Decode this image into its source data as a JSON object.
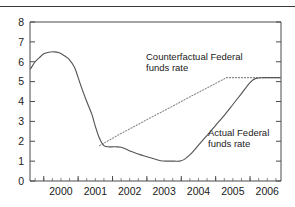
{
  "chart_data": {
    "type": "line",
    "title": "",
    "subtitle": "",
    "xlabel": "",
    "ylabel": "",
    "xlim": [
      1999.6,
      2006.9
    ],
    "ylim": [
      0,
      8
    ],
    "grid": false,
    "legend_position": "inline-annotations",
    "y_ticks": [
      "0",
      "1",
      "2",
      "3",
      "4",
      "5",
      "6",
      "7",
      "8"
    ],
    "y_tick_values": [
      0,
      1,
      2,
      3,
      4,
      5,
      6,
      7,
      8
    ],
    "x_ticks": [
      "2000",
      "2001",
      "2002",
      "2003",
      "2004",
      "2005",
      "2006"
    ],
    "x_tick_values": [
      2000,
      2001,
      2002,
      2003,
      2004,
      2005,
      2006
    ],
    "x_minor_interval": 0.25,
    "annotations": [
      {
        "name": "counterfactual-label",
        "line1": "Counterfactual Federal",
        "line2": "funds rate"
      },
      {
        "name": "actual-label",
        "line1": "Actual Federal",
        "line2": "funds rate"
      }
    ],
    "series": [
      {
        "name": "Actual Federal funds rate",
        "style": "solid",
        "color": "#555555",
        "x": [
          1999.62,
          1999.75,
          1999.9,
          2000.0,
          2000.15,
          2000.3,
          2000.45,
          2000.6,
          2000.75,
          2000.9,
          2001.0,
          2001.12,
          2001.25,
          2001.4,
          2001.5,
          2001.62,
          2001.75,
          2001.9,
          2002.0,
          2002.12,
          2002.25,
          2002.4,
          2002.55,
          2002.7,
          2002.85,
          2003.0,
          2003.2,
          2003.4,
          2003.6,
          2003.8,
          2003.95,
          2004.1,
          2004.3,
          2004.5,
          2004.75,
          2005.0,
          2005.25,
          2005.5,
          2005.75,
          2006.0,
          2006.15,
          2006.4,
          2006.7,
          2006.88
        ],
        "y": [
          5.65,
          6.0,
          6.25,
          6.4,
          6.48,
          6.5,
          6.45,
          6.3,
          6.1,
          5.7,
          5.2,
          4.6,
          4.0,
          3.35,
          2.75,
          2.15,
          1.78,
          1.72,
          1.72,
          1.72,
          1.7,
          1.6,
          1.48,
          1.38,
          1.3,
          1.22,
          1.12,
          1.02,
          1.0,
          1.0,
          1.0,
          1.1,
          1.4,
          1.8,
          2.3,
          2.8,
          3.3,
          3.85,
          4.4,
          4.95,
          5.15,
          5.2,
          5.2,
          5.2
        ]
      },
      {
        "name": "Counterfactual Federal funds rate",
        "style": "dotted",
        "color": "#8a8a8a",
        "x": [
          2001.62,
          2001.9,
          2002.2,
          2002.5,
          2002.8,
          2003.1,
          2003.4,
          2003.7,
          2004.0,
          2004.3,
          2004.6,
          2004.9,
          2005.15,
          2005.32,
          2005.6,
          2006.0,
          2006.4,
          2006.88
        ],
        "y": [
          1.78,
          2.05,
          2.35,
          2.62,
          2.9,
          3.18,
          3.45,
          3.72,
          4.0,
          4.28,
          4.55,
          4.82,
          5.05,
          5.2,
          5.2,
          5.2,
          5.2,
          5.2
        ]
      }
    ]
  },
  "colors": {
    "frame": "#4a4a4a",
    "actual": "#555555",
    "counterfactual": "#8a8a8a",
    "text": "#1a1a1a",
    "background": "#ffffff"
  }
}
